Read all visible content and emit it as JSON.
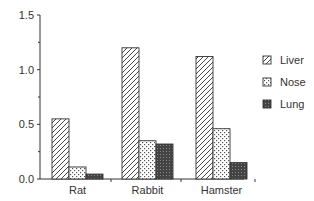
{
  "chart_data": {
    "type": "bar",
    "title": "",
    "xlabel": "",
    "ylabel": "",
    "ylim": [
      0,
      1.5
    ],
    "yticks": [
      "0.0",
      "0.5",
      "1.0",
      "1.5"
    ],
    "categories": [
      "Rat",
      "Rabbit",
      "Hamster"
    ],
    "series": [
      {
        "name": "Liver",
        "pattern": "diagonal-hatch",
        "values": [
          0.55,
          1.2,
          1.12
        ]
      },
      {
        "name": "Nose",
        "pattern": "dotted-crosshatch",
        "values": [
          0.11,
          0.35,
          0.46
        ]
      },
      {
        "name": "Lung",
        "pattern": "dark-stipple",
        "values": [
          0.045,
          0.32,
          0.15
        ]
      }
    ],
    "legend_position": "right",
    "grid": false
  }
}
